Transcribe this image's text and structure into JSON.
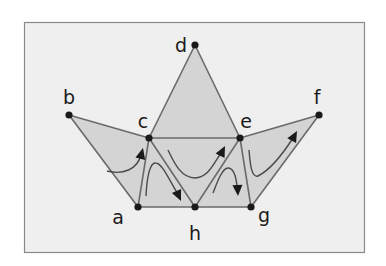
{
  "diagram": {
    "type": "triangulation-with-paths",
    "colors": {
      "frame_background": "#efefef",
      "frame_border": "#8a8a8a",
      "face_fill": "#d4d4d4",
      "edge": "#6a6a6a",
      "vertex": "#1a1a1a",
      "path": "#4a4a4a",
      "label": "#1a1a1a"
    },
    "vertices": [
      {
        "id": "a",
        "label": "a",
        "x": 138,
        "y": 207,
        "label_x": 118,
        "label_y": 224
      },
      {
        "id": "b",
        "label": "b",
        "x": 69,
        "y": 115,
        "label_x": 69,
        "label_y": 104
      },
      {
        "id": "c",
        "label": "c",
        "x": 149,
        "y": 138,
        "label_x": 143,
        "label_y": 128
      },
      {
        "id": "d",
        "label": "d",
        "x": 195,
        "y": 45,
        "label_x": 181,
        "label_y": 52
      },
      {
        "id": "e",
        "label": "e",
        "x": 240,
        "y": 138,
        "label_x": 246,
        "label_y": 128
      },
      {
        "id": "f",
        "label": "f",
        "x": 319,
        "y": 115,
        "label_x": 317,
        "label_y": 104
      },
      {
        "id": "g",
        "label": "g",
        "x": 251,
        "y": 207,
        "label_x": 264,
        "label_y": 222
      },
      {
        "id": "h",
        "label": "h",
        "x": 195,
        "y": 207,
        "label_x": 195,
        "label_y": 240
      }
    ],
    "faces": [
      [
        "b",
        "c",
        "a"
      ],
      [
        "c",
        "h",
        "a"
      ],
      [
        "c",
        "e",
        "h"
      ],
      [
        "c",
        "d",
        "e"
      ],
      [
        "e",
        "g",
        "h"
      ],
      [
        "e",
        "f",
        "g"
      ]
    ],
    "edges": [
      [
        "a",
        "b"
      ],
      [
        "b",
        "c"
      ],
      [
        "c",
        "a"
      ],
      [
        "c",
        "h"
      ],
      [
        "a",
        "h"
      ],
      [
        "c",
        "e"
      ],
      [
        "c",
        "d"
      ],
      [
        "d",
        "e"
      ],
      [
        "e",
        "h"
      ],
      [
        "h",
        "g"
      ],
      [
        "e",
        "g"
      ],
      [
        "e",
        "f"
      ],
      [
        "f",
        "g"
      ]
    ],
    "paths": [
      {
        "id": "path-1",
        "d": "M 107 171 C 122 175, 138 170, 141 154",
        "arrow_tip": [
          143,
          148
        ],
        "arrow_dir": [
          0.25,
          -1
        ]
      },
      {
        "id": "path-2",
        "d": "M 146 196 C 147 176, 150 162, 156 163 C 163 164, 170 182, 178 194",
        "arrow_tip": [
          181,
          201
        ],
        "arrow_dir": [
          0.45,
          1
        ]
      },
      {
        "id": "path-3",
        "d": "M 168 150 C 175 165, 182 178, 195 178 C 208 178, 214 163, 221 153",
        "arrow_tip": [
          225,
          146
        ],
        "arrow_dir": [
          0.5,
          -1
        ]
      },
      {
        "id": "path-4",
        "d": "M 213 193 C 217 183, 222 168, 228 168 C 234 168, 236 177, 237 186",
        "arrow_tip": [
          238,
          196
        ],
        "arrow_dir": [
          0.05,
          1
        ]
      },
      {
        "id": "path-5",
        "d": "M 249 150 C 250 162, 251 178, 258 176 C 270 170, 284 152, 293 138",
        "arrow_tip": [
          297,
          131
        ],
        "arrow_dir": [
          0.55,
          -1
        ]
      }
    ]
  }
}
